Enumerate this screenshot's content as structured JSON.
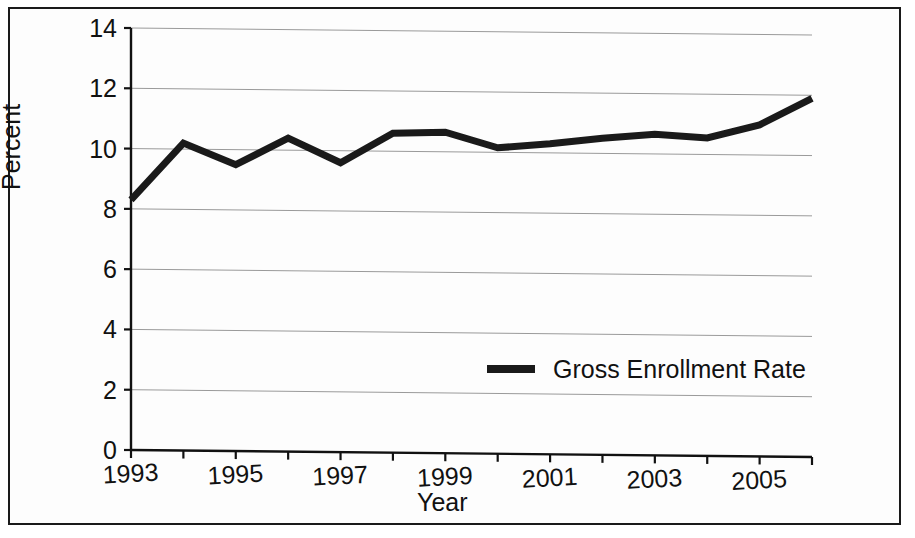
{
  "chart_data": {
    "type": "line",
    "title": "",
    "xlabel": "Year",
    "ylabel": "Percent",
    "x": [
      1993,
      1994,
      1995,
      1996,
      1997,
      1998,
      1999,
      2000,
      2001,
      2002,
      2003,
      2004,
      2005,
      2006
    ],
    "xtick_labels": [
      "1993",
      "1995",
      "1997",
      "1999",
      "2001",
      "2003",
      "2005"
    ],
    "xtick_values": [
      1993,
      1995,
      1997,
      1999,
      2001,
      2003,
      2005
    ],
    "xlim": [
      1993,
      2006
    ],
    "ytick_labels": [
      "0",
      "2",
      "4",
      "6",
      "8",
      "10",
      "12",
      "14"
    ],
    "ytick_values": [
      0,
      2,
      4,
      6,
      8,
      10,
      12,
      14
    ],
    "ylim": [
      0,
      14
    ],
    "grid": true,
    "grid_axis": "y",
    "legend_position": "inside-center",
    "series": [
      {
        "name": "Gross Enrollment Rate",
        "color": "#1a1a1a",
        "line_width": 7,
        "values": [
          8.3,
          10.2,
          9.5,
          10.4,
          9.6,
          10.6,
          10.65,
          10.15,
          10.3,
          10.5,
          10.65,
          10.55,
          11.0,
          11.9
        ]
      }
    ]
  },
  "legend": {
    "entries": [
      {
        "label": "Gross Enrollment Rate",
        "swatch_color": "#1a1a1a"
      }
    ]
  },
  "axes": {
    "y_title": "Percent",
    "x_title": "Year"
  }
}
